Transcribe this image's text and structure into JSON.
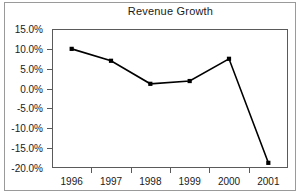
{
  "chart_data": {
    "type": "line",
    "title": "Revenue Growth",
    "xlabel": "",
    "ylabel": "",
    "categories": [
      "1996",
      "1997",
      "1998",
      "1999",
      "2000",
      "2001"
    ],
    "values": [
      10.0,
      7.0,
      1.2,
      1.9,
      7.5,
      -18.7
    ],
    "series": [
      {
        "name": "Revenue Growth",
        "values": [
          10.0,
          7.0,
          1.2,
          1.9,
          7.5,
          -18.7
        ]
      }
    ],
    "ylim": [
      -20.0,
      15.0
    ],
    "ytick_values": [
      15.0,
      10.0,
      5.0,
      0.0,
      -5.0,
      -10.0,
      -15.0,
      -20.0
    ],
    "ytick_labels": [
      "15.0%",
      "10.0%",
      "5.0%",
      "0.0%",
      "-5.0%",
      "-10.0%",
      "-15.0%",
      "-20.0%"
    ],
    "grid": false,
    "legend": "none",
    "marker": "filled-square",
    "line_color": "#000000",
    "marker_color": "#000000",
    "axis_color": "#5a5a5a",
    "plot_background": "#ffffff",
    "frame_color": "#9a9a9a"
  }
}
